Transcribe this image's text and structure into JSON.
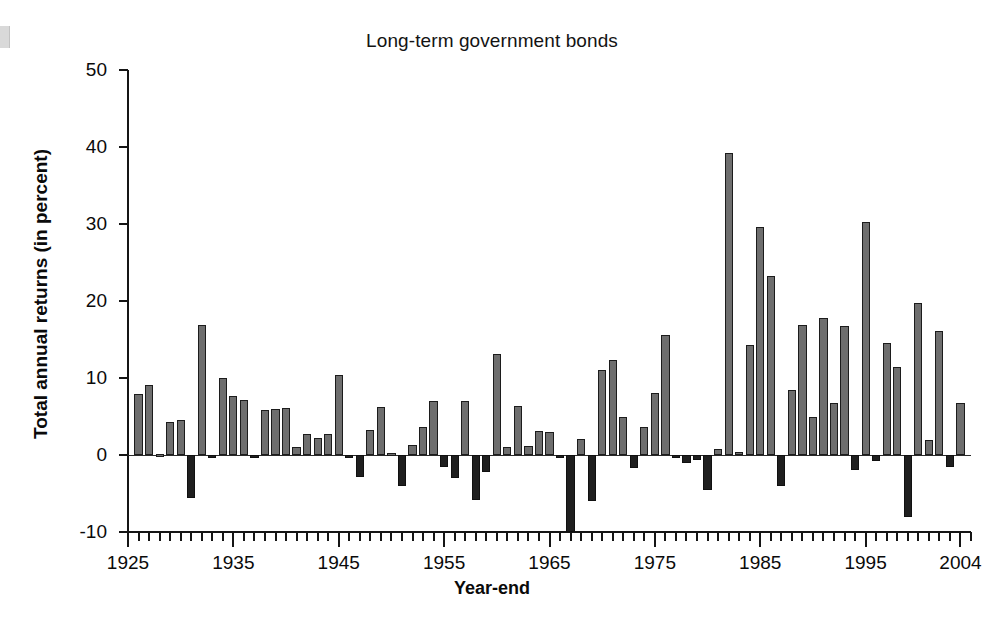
{
  "chart_data": {
    "type": "bar",
    "title": "Long-term government bonds",
    "xlabel": "Year-end",
    "ylabel": "Total annual returns (in percent)",
    "ylim": [
      -10,
      50
    ],
    "xlim": [
      1925,
      2005
    ],
    "grid": false,
    "legend": null,
    "y_ticks": [
      50,
      40,
      30,
      20,
      10,
      0,
      -10
    ],
    "y_tick_labels": [
      "50",
      "40",
      "30",
      "20",
      "10",
      "0",
      "-10"
    ],
    "x_tick_labels": [
      "1925",
      "1935",
      "1945",
      "1955",
      "1965",
      "1975",
      "1985",
      "1995",
      "2004"
    ],
    "x_tick_years": [
      1925,
      1935,
      1945,
      1955,
      1965,
      1975,
      1985,
      1995,
      2004
    ],
    "x_minor_tick_step": 1,
    "bar_color_positive": "#6e6e6e",
    "bar_color_negative": "#1f1f1f",
    "categories": [
      1926,
      1927,
      1928,
      1929,
      1930,
      1931,
      1932,
      1933,
      1934,
      1935,
      1936,
      1937,
      1938,
      1939,
      1940,
      1941,
      1942,
      1943,
      1944,
      1945,
      1946,
      1947,
      1948,
      1949,
      1950,
      1951,
      1952,
      1953,
      1954,
      1955,
      1956,
      1957,
      1958,
      1959,
      1960,
      1961,
      1962,
      1963,
      1964,
      1965,
      1966,
      1967,
      1968,
      1969,
      1970,
      1971,
      1972,
      1973,
      1974,
      1975,
      1976,
      1977,
      1978,
      1979,
      1980,
      1981,
      1982,
      1983,
      1984,
      1985,
      1986,
      1987,
      1988,
      1989,
      1990,
      1991,
      1992,
      1993,
      1994,
      1995,
      1996,
      1997,
      1998,
      1999,
      2000,
      2001,
      2002,
      2003,
      2004
    ],
    "values": [
      7.9,
      9.1,
      0.1,
      4.3,
      4.5,
      -5.6,
      16.9,
      -0.2,
      10.0,
      7.6,
      7.1,
      -0.3,
      5.8,
      6.0,
      6.1,
      1.0,
      2.7,
      2.2,
      2.7,
      10.4,
      -0.2,
      -2.9,
      3.3,
      6.2,
      0.3,
      -4.0,
      1.3,
      3.6,
      7.0,
      -1.6,
      -3.0,
      7.0,
      -5.8,
      -2.2,
      13.1,
      1.0,
      6.4,
      1.2,
      3.1,
      3.0,
      -0.4,
      -10.0,
      2.1,
      -6.0,
      11.1,
      12.3,
      4.9,
      -1.7,
      3.6,
      8.0,
      15.6,
      -0.3,
      -1.0,
      -0.6,
      -4.5,
      0.8,
      39.2,
      0.4,
      14.3,
      29.6,
      23.2,
      -4.0,
      8.4,
      16.9,
      4.9,
      17.8,
      6.8,
      16.8,
      -1.9,
      30.2,
      -0.8,
      14.5,
      11.4,
      -8.0,
      19.8,
      2.0,
      16.1,
      -1.5,
      6.8
    ]
  }
}
